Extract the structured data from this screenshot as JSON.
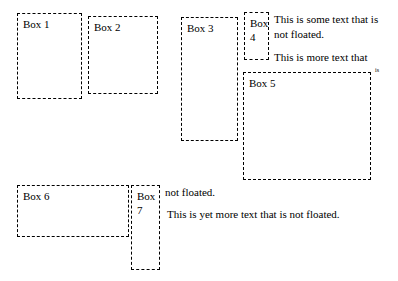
{
  "page": {
    "boxes": [
      {
        "id": "box1",
        "label": "Box 1"
      },
      {
        "id": "box2",
        "label": "Box 2"
      },
      {
        "id": "box3",
        "label": "Box 3"
      },
      {
        "id": "box4",
        "label": "Box 4"
      },
      {
        "id": "box5",
        "label": "Box 5"
      },
      {
        "id": "box6",
        "label": "Box 6"
      },
      {
        "id": "box7",
        "label": "Box 7"
      }
    ],
    "texts": {
      "t1": "This is some text that is not floated.",
      "t2": "This is more text that",
      "t3": "is",
      "t4": "not floated.",
      "t5": "This is yet more text that is not floated."
    }
  }
}
